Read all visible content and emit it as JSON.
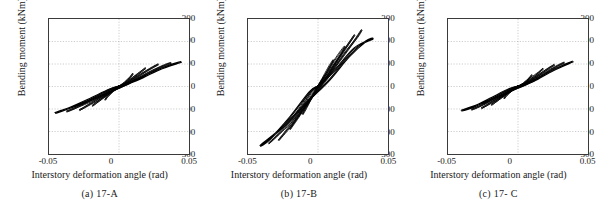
{
  "figure": {
    "panels": [
      {
        "caption": "(a)  17-A",
        "xlabel": "Interstory deformation angle (rad)",
        "ylabel": "Bending moment (kNm)",
        "xticks": [
          "-0.05",
          "0",
          "0.05"
        ],
        "yticks": [
          "300",
          "200",
          "100",
          "0",
          "-100",
          "-200",
          "-300"
        ]
      },
      {
        "caption": "(b)  17-B",
        "xlabel": "Interstory deformation angle (rad)",
        "ylabel": "Bending moment (kNm)",
        "xticks": [
          "-0.05",
          "0",
          "0.05"
        ],
        "yticks": [
          "300",
          "200",
          "100",
          "0",
          "-100",
          "-200",
          "-300"
        ]
      },
      {
        "caption": "(c)  17- C",
        "xlabel": "Interstory deformation angle (rad)",
        "ylabel": "Bending moment (kNm)",
        "xticks": [
          "-0.05",
          "0",
          "0.05"
        ],
        "yticks": [
          "300",
          "200",
          "100",
          "0",
          "-100",
          "-200",
          "-300"
        ]
      }
    ]
  },
  "chart_data": [
    {
      "type": "line",
      "title": "(a)  17-A",
      "xlabel": "Interstory deformation angle (rad)",
      "ylabel": "Bending moment (kNm)",
      "xlim": [
        -0.05,
        0.05
      ],
      "ylim": [
        -300,
        300
      ],
      "xticks": [
        -0.05,
        0,
        0.05
      ],
      "yticks": [
        -300,
        -200,
        -100,
        0,
        100,
        200,
        300
      ],
      "grid": true,
      "legend": "none",
      "description": "Hysteresis loops of bending moment vs interstory deformation angle, specimen 17-A. Pinched S-shaped cycles of increasing amplitude.",
      "series": [
        {
          "name": "cycle-1",
          "x": [
            0,
            0.004,
            0.008,
            0.01,
            0.008,
            0.004,
            0.0,
            -0.004,
            -0.008,
            -0.01,
            -0.008,
            -0.004,
            0
          ],
          "y": [
            0,
            18,
            42,
            58,
            40,
            16,
            -2,
            -20,
            -44,
            -60,
            -42,
            -16,
            0
          ]
        },
        {
          "name": "cycle-2",
          "x": [
            0,
            0.006,
            0.013,
            0.019,
            0.016,
            0.01,
            0.003,
            -0.004,
            -0.012,
            -0.019,
            -0.016,
            -0.009,
            -0.002,
            0
          ],
          "y": [
            0,
            20,
            52,
            82,
            68,
            40,
            8,
            -16,
            -52,
            -86,
            -72,
            -40,
            -6,
            0
          ]
        },
        {
          "name": "cycle-3",
          "x": [
            0,
            0.008,
            0.018,
            0.028,
            0.024,
            0.015,
            0.005,
            -0.004,
            -0.015,
            -0.028,
            -0.024,
            -0.014,
            -0.004,
            0
          ],
          "y": [
            0,
            22,
            62,
            98,
            86,
            52,
            12,
            -18,
            -60,
            -104,
            -90,
            -50,
            -10,
            0
          ]
        },
        {
          "name": "cycle-4",
          "x": [
            0,
            0.01,
            0.024,
            0.037,
            0.032,
            0.02,
            0.007,
            -0.005,
            -0.02,
            -0.037,
            -0.032,
            -0.019,
            -0.006,
            0
          ],
          "y": [
            0,
            24,
            70,
            104,
            94,
            58,
            14,
            -20,
            -66,
            -110,
            -98,
            -56,
            -12,
            0
          ]
        },
        {
          "name": "cycle-5",
          "x": [
            0,
            0.012,
            0.028,
            0.044,
            0.038,
            0.024,
            0.008,
            -0.006,
            -0.024,
            -0.045,
            -0.038,
            -0.022,
            -0.007,
            0
          ],
          "y": [
            0,
            26,
            74,
            108,
            98,
            62,
            16,
            -22,
            -70,
            -116,
            -102,
            -58,
            -14,
            0
          ]
        }
      ],
      "peaks": {
        "positive_moment": 108,
        "negative_moment": -116,
        "positive_angle": 0.044,
        "negative_angle": -0.045
      }
    },
    {
      "type": "line",
      "title": "(b)  17-B",
      "xlabel": "Interstory deformation angle (rad)",
      "ylabel": "Bending moment (kNm)",
      "xlim": [
        -0.05,
        0.05
      ],
      "ylim": [
        -300,
        300
      ],
      "xticks": [
        -0.05,
        0,
        0.05
      ],
      "yticks": [
        -300,
        -200,
        -100,
        0,
        100,
        200,
        300
      ],
      "grid": true,
      "legend": "none",
      "description": "Hysteresis loops of bending moment vs interstory deformation angle, specimen 17-B. Fatter loops reaching about +250 / -260 kNm.",
      "series": [
        {
          "name": "cycle-1",
          "x": [
            0,
            0.004,
            0.008,
            0.011,
            0.009,
            0.005,
            0.0,
            -0.004,
            -0.008,
            -0.011,
            -0.009,
            -0.004,
            0
          ],
          "y": [
            0,
            45,
            90,
            118,
            92,
            48,
            2,
            -42,
            -92,
            -124,
            -96,
            -46,
            0
          ]
        },
        {
          "name": "cycle-2",
          "x": [
            0,
            0.006,
            0.013,
            0.019,
            0.017,
            0.011,
            0.004,
            -0.005,
            -0.013,
            -0.02,
            -0.017,
            -0.01,
            -0.002,
            0
          ],
          "y": [
            0,
            58,
            128,
            178,
            150,
            92,
            22,
            -52,
            -128,
            -190,
            -158,
            -94,
            -16,
            0
          ]
        },
        {
          "name": "cycle-3",
          "x": [
            0,
            0.008,
            0.018,
            0.026,
            0.023,
            0.015,
            0.005,
            -0.006,
            -0.017,
            -0.028,
            -0.024,
            -0.014,
            -0.004,
            0
          ],
          "y": [
            0,
            66,
            156,
            228,
            200,
            126,
            28,
            -62,
            -158,
            -238,
            -206,
            -120,
            -20,
            0
          ]
        },
        {
          "name": "cycle-4",
          "x": [
            0,
            0.01,
            0.022,
            0.031,
            0.028,
            0.018,
            0.006,
            -0.007,
            -0.022,
            -0.035,
            -0.03,
            -0.017,
            -0.005,
            0
          ],
          "y": [
            0,
            70,
            168,
            250,
            218,
            140,
            30,
            -68,
            -176,
            -252,
            -222,
            -130,
            -22,
            0
          ]
        },
        {
          "name": "cycle-5",
          "x": [
            0,
            0.012,
            0.026,
            0.039,
            0.034,
            0.022,
            0.008,
            -0.008,
            -0.025,
            -0.041,
            -0.034,
            -0.02,
            -0.006,
            0
          ],
          "y": [
            0,
            72,
            170,
            212,
            200,
            132,
            28,
            -70,
            -180,
            -262,
            -232,
            -136,
            -24,
            0
          ]
        }
      ],
      "peaks": {
        "positive_moment": 250,
        "negative_moment": -262,
        "positive_angle": 0.039,
        "negative_angle": -0.041
      }
    },
    {
      "type": "line",
      "title": "(c)  17- C",
      "xlabel": "Interstory deformation angle (rad)",
      "ylabel": "Bending moment (kNm)",
      "xlim": [
        -0.05,
        0.05
      ],
      "ylim": [
        -300,
        300
      ],
      "xticks": [
        -0.05,
        0,
        0.05
      ],
      "yticks": [
        -300,
        -200,
        -100,
        0,
        100,
        200,
        300
      ],
      "grid": true,
      "legend": "none",
      "description": "Hysteresis loops of bending moment vs interstory deformation angle, specimen 17-C. Narrow pinched S-shaped cycles peaking near +110 / -105 kNm.",
      "series": [
        {
          "name": "cycle-1",
          "x": [
            0,
            0.004,
            0.008,
            0.01,
            0.008,
            0.004,
            0.0,
            -0.004,
            -0.008,
            -0.01,
            -0.008,
            -0.004,
            0
          ],
          "y": [
            0,
            14,
            36,
            52,
            36,
            14,
            -2,
            -16,
            -38,
            -54,
            -38,
            -14,
            0
          ]
        },
        {
          "name": "cycle-2",
          "x": [
            0,
            0.006,
            0.013,
            0.018,
            0.015,
            0.009,
            0.003,
            -0.004,
            -0.012,
            -0.019,
            -0.016,
            -0.009,
            -0.002,
            0
          ],
          "y": [
            0,
            18,
            50,
            80,
            64,
            36,
            6,
            -16,
            -50,
            -82,
            -68,
            -36,
            -6,
            0
          ]
        },
        {
          "name": "cycle-3",
          "x": [
            0,
            0.008,
            0.017,
            0.026,
            0.022,
            0.014,
            0.004,
            -0.005,
            -0.015,
            -0.026,
            -0.022,
            -0.013,
            -0.003,
            0
          ],
          "y": [
            0,
            20,
            60,
            96,
            82,
            48,
            10,
            -18,
            -58,
            -96,
            -82,
            -46,
            -8,
            0
          ]
        },
        {
          "name": "cycle-4",
          "x": [
            0,
            0.01,
            0.022,
            0.033,
            0.028,
            0.018,
            0.006,
            -0.005,
            -0.019,
            -0.033,
            -0.028,
            -0.017,
            -0.005,
            0
          ],
          "y": [
            0,
            22,
            68,
            106,
            92,
            56,
            12,
            -20,
            -64,
            -102,
            -90,
            -52,
            -10,
            0
          ]
        },
        {
          "name": "cycle-5",
          "x": [
            0,
            0.011,
            0.025,
            0.039,
            0.033,
            0.021,
            0.007,
            -0.006,
            -0.022,
            -0.04,
            -0.033,
            -0.02,
            -0.006,
            0
          ],
          "y": [
            0,
            24,
            72,
            110,
            96,
            58,
            13,
            -21,
            -66,
            -106,
            -94,
            -54,
            -11,
            0
          ]
        }
      ],
      "peaks": {
        "positive_moment": 110,
        "negative_moment": -106,
        "positive_angle": 0.039,
        "negative_angle": -0.04
      }
    }
  ]
}
